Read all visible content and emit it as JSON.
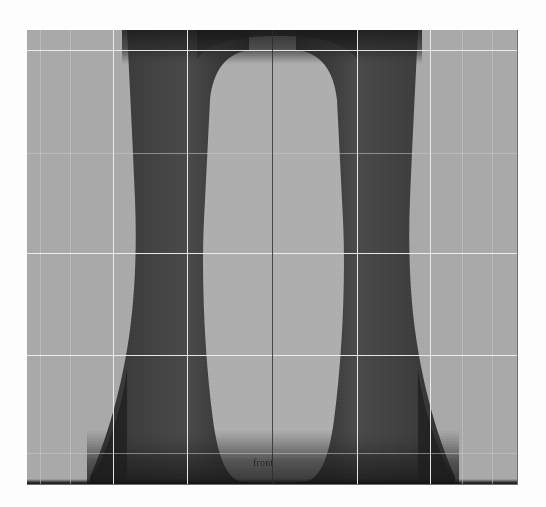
{
  "app": {
    "kind": "3d-modeling-viewport",
    "view_label": "front"
  },
  "viewport": {
    "label": "front",
    "background_color": "#a9a9a9",
    "object_shade_color": "#343434",
    "grid_line_color": "#c9c9c9",
    "bright_line_color": "#efefef",
    "axis_color": "#2c2c2c",
    "border_color": "#6e6e6e"
  },
  "grid": {
    "vertical_lines_x": [
      40,
      70,
      113,
      187,
      272,
      357,
      430,
      462
    ],
    "horizontal_lines_y": [
      50,
      153,
      253,
      355,
      453
    ],
    "bright_vertical_lines_x": [
      113,
      187,
      357,
      430
    ],
    "bright_horizontal_lines_y": [
      50,
      253,
      355
    ],
    "axis_x": 245
  },
  "geometry": {
    "description": "lathed vase profile, mirrored left and right of centre",
    "left_profile": "M 75 0 L 75 40 C 88 120 92 170 96 205 C 99 240 96 290 88 330 C 80 375 68 415 52 446 L 52 455 L 0 455 L 0 0 Z",
    "right_profile": "M 416 0 L 416 40 C 403 120 399 170 395 205 C 392 240 395 290 403 330 C 411 375 423 415 439 446 L 439 455 L 491 455 L 491 0 Z",
    "centre_body_top_y": 22,
    "centre_body_bottom_y": 452
  },
  "colors": {
    "page_background": "#fdfdfd",
    "light_gray": "#a9a9a9",
    "mid_gray": "#6e6e6e",
    "dark": "#2e2e2e"
  }
}
